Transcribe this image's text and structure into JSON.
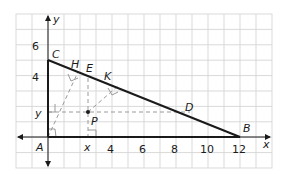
{
  "figure": {
    "title": "",
    "axes": {
      "x_label": "x",
      "y_label": "y"
    },
    "x_ticks": [
      "4",
      "6",
      "8",
      "10",
      "12"
    ],
    "y_ticks": [
      "4",
      "6"
    ],
    "points": {
      "A": "A",
      "B": "B",
      "C": "C",
      "D": "D",
      "E": "E",
      "H": "H",
      "K": "K",
      "P": "P"
    },
    "point_coords": {
      "A": [
        0,
        0
      ],
      "B": [
        12,
        0
      ],
      "C": [
        0,
        5
      ],
      "H": [
        1.9,
        4.2
      ],
      "E": [
        3,
        3.8
      ],
      "K": [
        4.3,
        3.2
      ],
      "D": [
        8.8,
        1.4
      ],
      "P": [
        2.6,
        1.6
      ]
    },
    "segment_labels": {
      "x": "x",
      "y": "y"
    },
    "colors": {
      "grid": "#d9d9d9",
      "triangle": "#1a1a1a",
      "dashed": "#9a9a9a"
    }
  }
}
